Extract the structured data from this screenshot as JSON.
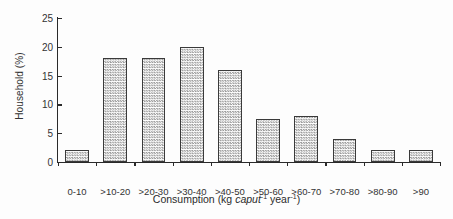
{
  "chart_data": {
    "type": "bar",
    "title": "",
    "subtitle": "",
    "xlabel": "Consumption (kg caput-1 year-1)",
    "xlabel_parts": {
      "pre": "Consumption (kg ",
      "italic": "caput",
      "sup1": "-1",
      "mid": " year",
      "sup2": "-1",
      "post": ")"
    },
    "ylabel": "Household (%)",
    "categories": [
      "0-10",
      ">10-20",
      ">20-30",
      ">30-40",
      ">40-50",
      ">50-60",
      ">60-70",
      ">70-80",
      ">80-90",
      ">90"
    ],
    "values": [
      2,
      18,
      18,
      20,
      16,
      7.5,
      8,
      4,
      2,
      2
    ],
    "ylim": [
      0,
      25
    ],
    "yticks": [
      0,
      5,
      10,
      15,
      20,
      25
    ],
    "ytick_labels": [
      "0",
      "5",
      "10",
      "15",
      "20",
      "25"
    ],
    "grid": false,
    "legend": null,
    "bar_fill": "#ffffff",
    "bar_pattern": "fine-checker-gray",
    "bar_edge_color": "#3a3a3a",
    "axis_color": "#2a2a2a",
    "background": "#fdfdfd"
  }
}
